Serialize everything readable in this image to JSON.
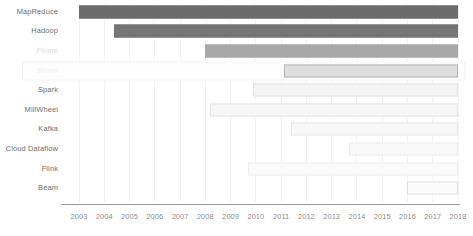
{
  "chart_data": {
    "type": "bar",
    "orientation": "horizontal",
    "subtype": "gantt-timeline",
    "title": "",
    "subtitle": "",
    "xlabel": "",
    "ylabel": "",
    "xlim": [
      2003,
      2018
    ],
    "grid": true,
    "legend": "none",
    "x_tick_labels": [
      "2003",
      "2004",
      "2005",
      "2006",
      "2007",
      "2008",
      "2009",
      "2010",
      "2011",
      "2012",
      "2013",
      "2014",
      "2015",
      "2016",
      "2017",
      "2018"
    ],
    "x_ticks": [
      2003,
      2004,
      2005,
      2006,
      2007,
      2008,
      2009,
      2010,
      2011,
      2012,
      2013,
      2014,
      2015,
      2016,
      2017,
      2018
    ],
    "categories": [
      "MapReduce",
      "Hadoop",
      "Flume",
      "Storm",
      "Spark",
      "MillWheel",
      "Kafka",
      "Cloud Dataflow",
      "Flink",
      "Beam"
    ],
    "bars": [
      {
        "label": "MapReduce",
        "start": 2003.0,
        "end": 2018.0,
        "color": "#6b6b6b",
        "border": "#6b6b6b",
        "label_color": "#6e6e6e",
        "highlight": false
      },
      {
        "label": "Hadoop",
        "start": 2004.4,
        "end": 2018.0,
        "color": "#757575",
        "border": "#757575",
        "label_color": "#6e6e6e",
        "highlight": false
      },
      {
        "label": "Flume",
        "start": 2008.0,
        "end": 2018.0,
        "color": "#a8a8a8",
        "border": "#a8a8a8",
        "label_color": "#d8d8d8",
        "highlight": false
      },
      {
        "label": "Storm",
        "start": 2011.1,
        "end": 2018.0,
        "color": "#dedede",
        "border": "#b5b5b5",
        "label_color": "#f0f0f0",
        "highlight": true
      },
      {
        "label": "Spark",
        "start": 2009.9,
        "end": 2018.0,
        "color": "#f4f4f4",
        "border": "#e2e2e2",
        "label_color": "#6e6e6e",
        "highlight": false
      },
      {
        "label": "MillWheel",
        "start": 2008.2,
        "end": 2018.0,
        "color": "#f6f6f6",
        "border": "#e4e4e4",
        "label_color": "#6e6e6e",
        "highlight": false
      },
      {
        "label": "Kafka",
        "start": 2011.4,
        "end": 2018.0,
        "color": "#f7f7f7",
        "border": "#e6e6e6",
        "label_color": "#6e6e6e",
        "highlight": false
      },
      {
        "label": "Cloud Dataflow",
        "start": 2013.7,
        "end": 2018.0,
        "color": "#f8f8f8",
        "border": "#ececec",
        "label_color": "#6e6e6e",
        "highlight": false
      },
      {
        "label": "Flink",
        "start": 2009.7,
        "end": 2018.0,
        "color": "#fafafa",
        "border": "#ededed",
        "label_color": "#6e6e6e",
        "highlight": false
      },
      {
        "label": "Beam",
        "start": 2016.0,
        "end": 2018.0,
        "color": "#fbfbfb",
        "border": "#dcdcdc",
        "label_color": "#6e6e6e",
        "highlight": false
      }
    ],
    "colors": {
      "axis": "#9a9a9a",
      "grid": "#f2f2f2",
      "tick_text": "#8c8c8c",
      "label_text": "#6e6e6e",
      "background": "#ffffff"
    }
  }
}
